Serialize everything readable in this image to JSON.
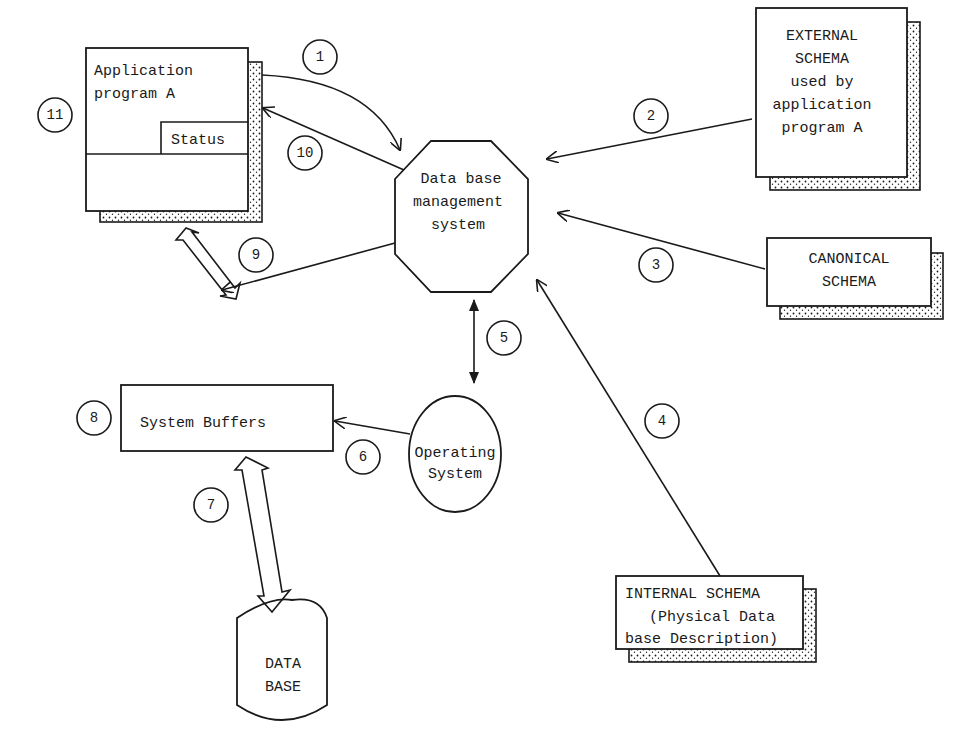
{
  "diagram": {
    "nodes": {
      "app_program": {
        "line1": "Application",
        "line2": "program A",
        "status": "Status"
      },
      "dbms": {
        "line1": "Data base",
        "line2": "management",
        "line3": "system"
      },
      "external_schema": {
        "line1": "EXTERNAL",
        "line2": "SCHEMA",
        "line3": "used by",
        "line4": "application",
        "line5": "program A"
      },
      "canonical_schema": {
        "line1": "CANONICAL",
        "line2": "SCHEMA"
      },
      "internal_schema": {
        "line1": "INTERNAL SCHEMA",
        "line2": "(Physical Data",
        "line3": "base Description)"
      },
      "system_buffers": {
        "label": "System Buffers"
      },
      "operating_system": {
        "line1": "Operating",
        "line2": "System"
      },
      "database": {
        "line1": "DATA",
        "line2": "BASE"
      }
    },
    "step_numbers": [
      "1",
      "2",
      "3",
      "4",
      "5",
      "6",
      "7",
      "8",
      "9",
      "10",
      "11"
    ],
    "colors": {
      "ink": "#1a1a1a",
      "paper": "#ffffff"
    }
  }
}
